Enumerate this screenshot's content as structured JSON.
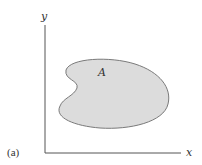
{
  "figure": {
    "panel_label": "(a)",
    "region_label": "A",
    "axes": {
      "x_label": "x",
      "y_label": "y"
    },
    "colors": {
      "region_fill": "#dcdcdc",
      "region_stroke": "#7a7a7a",
      "axis": "#555555",
      "text": "#333333"
    }
  }
}
